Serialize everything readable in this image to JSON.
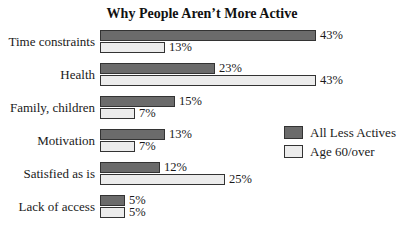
{
  "chart_data": {
    "type": "bar",
    "orientation": "horizontal",
    "title": "Why People Aren’t More Active",
    "xlabel": "",
    "ylabel": "",
    "categories": [
      "Time constraints",
      "Health",
      "Family, children",
      "Motivation",
      "Satisfied as is",
      "Lack of access"
    ],
    "series": [
      {
        "name": "All Less Actives",
        "color": "#6b6b6b",
        "values": [
          43,
          23,
          15,
          13,
          12,
          5
        ],
        "labels": [
          "43%",
          "23%",
          "15%",
          "13%",
          "12%",
          "5%"
        ]
      },
      {
        "name": "Age 60/over",
        "color": "#ececec",
        "values": [
          13,
          43,
          7,
          7,
          25,
          5
        ],
        "labels": [
          "13%",
          "43%",
          "7%",
          "7%",
          "25%",
          "5%"
        ]
      }
    ],
    "grid": false,
    "legend_position": "right",
    "value_unit": "%"
  },
  "legend": [
    {
      "label": "All Less Actives",
      "color": "#6b6b6b"
    },
    {
      "label": "Age 60/over",
      "color": "#ececec"
    }
  ]
}
